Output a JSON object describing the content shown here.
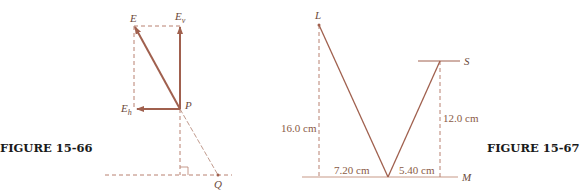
{
  "figures": [
    {
      "caption": "FIGURE 15-66",
      "labels": {
        "E": "E",
        "Ev_main": "E",
        "Ev_sub": "v",
        "Eh_main": "E",
        "Eh_sub": "h",
        "P": "P",
        "Q": "Q"
      }
    },
    {
      "caption": "FIGURE 15-67",
      "labels": {
        "L": "L",
        "S": "S",
        "M": "M",
        "height_L": "16.0 cm",
        "height_S": "12.0 cm",
        "dist_left": "7.20 cm",
        "dist_right": "5.40 cm"
      }
    }
  ],
  "colors": {
    "vector": "#a0604e",
    "dashed": "#b88070",
    "ground": "#c89a88"
  }
}
